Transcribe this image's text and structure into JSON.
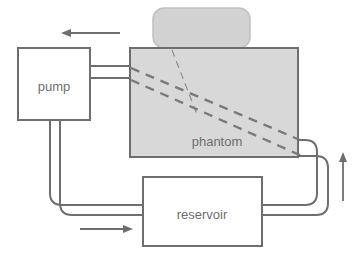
{
  "diagram": {
    "type": "schematic-flow-loop",
    "background_color": "#ffffff",
    "stroke_color": "#6e6e6e",
    "phantom_fill": "#d6d6d6",
    "transducer_fill": "#d0d0d0",
    "box_fill": "#ffffff",
    "text_color": "#6e6e6e",
    "nodes": [
      {
        "id": "pump",
        "label": "pump",
        "shape": "rectangle",
        "x": 18,
        "y": 48,
        "width": 72,
        "height": 72,
        "label_x": 54,
        "label_y": 88
      },
      {
        "id": "phantom",
        "label": "phantom",
        "shape": "rectangle",
        "x": 130,
        "y": 48,
        "width": 168,
        "height": 109,
        "label_x": 217,
        "label_y": 143
      },
      {
        "id": "reservoir",
        "label": "reservoir",
        "shape": "rectangle",
        "x": 143,
        "y": 177,
        "width": 119,
        "height": 69,
        "label_x": 202,
        "label_y": 216
      },
      {
        "id": "transducer",
        "label": "",
        "shape": "rounded-rectangle",
        "x": 153,
        "y": 8,
        "width": 97,
        "height": 40,
        "label_x": 201,
        "label_y": 28
      }
    ],
    "flow_arrows": [
      {
        "id": "arrow-pump-outlet-top",
        "direction": "left",
        "x1": 120,
        "y1": 33,
        "x2": 62,
        "y2": 33
      },
      {
        "id": "arrow-reservoir-inlet-bottom",
        "direction": "right",
        "x1": 80,
        "y1": 229,
        "x2": 133,
        "y2": 229
      },
      {
        "id": "arrow-phantom-return-right",
        "direction": "up",
        "x1": 343,
        "y1": 201,
        "x2": 343,
        "y2": 153
      }
    ],
    "beam_lines": [
      {
        "id": "beam-edge-upper",
        "style": "dashed-thick",
        "x1": 131,
        "y1": 68,
        "x2": 300,
        "y2": 140
      },
      {
        "id": "beam-edge-lower",
        "style": "dashed-thick",
        "x1": 131,
        "y1": 80,
        "x2": 302,
        "y2": 156
      },
      {
        "id": "beam-axis",
        "style": "dashed-thin",
        "x1": 172,
        "y1": 50,
        "x2": 198,
        "y2": 117
      }
    ],
    "pipes": [
      {
        "id": "pipe-pump-to-phantom-upper",
        "from": "pump",
        "to": "phantom",
        "path": "M 90 66 L 131 66"
      },
      {
        "id": "pipe-pump-to-phantom-lower",
        "from": "pump",
        "to": "phantom",
        "path": "M 90 78 L 131 78"
      },
      {
        "id": "pipe-pump-to-reservoir-inner",
        "from": "pump",
        "to": "reservoir",
        "path": "M 50 120 L 50 193 Q 50 205 62 205 L 144 205"
      },
      {
        "id": "pipe-pump-to-reservoir-outer",
        "from": "pump",
        "to": "reservoir",
        "path": "M 60 120 L 60 203 Q 60 215 72 215 L 144 215"
      },
      {
        "id": "pipe-reservoir-to-phantom-inner",
        "from": "reservoir",
        "to": "phantom",
        "path": "M 261 205 L 305 205 Q 317 205 317 193 L 317 152 Q 317 140 305 140 L 297 140"
      },
      {
        "id": "pipe-reservoir-to-phantom-outer",
        "from": "reservoir",
        "to": "phantom",
        "path": "M 261 215 L 315 215 Q 327 215 327 203 L 327 168 Q 327 156 315 156 L 297 156"
      }
    ],
    "labels": {
      "pump": "pump",
      "phantom": "phantom",
      "reservoir": "reservoir"
    }
  }
}
